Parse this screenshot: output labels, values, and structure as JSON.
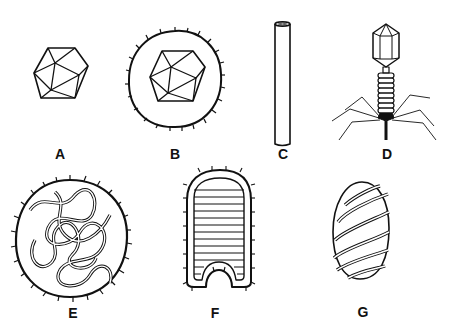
{
  "figure": {
    "panels": [
      {
        "id": "A",
        "label": "A",
        "shape": "icosahedral-capsid"
      },
      {
        "id": "B",
        "label": "B",
        "shape": "enveloped-icosahedral"
      },
      {
        "id": "C",
        "label": "C",
        "shape": "helical-rod"
      },
      {
        "id": "D",
        "label": "D",
        "shape": "bacteriophage"
      },
      {
        "id": "E",
        "label": "E",
        "shape": "enveloped-helical-coiled"
      },
      {
        "id": "F",
        "label": "F",
        "shape": "bullet-shaped"
      },
      {
        "id": "G",
        "label": "G",
        "shape": "spiral-wrapped-ovoid"
      }
    ],
    "colors": {
      "line": "#111111",
      "background": "#ffffff"
    }
  }
}
